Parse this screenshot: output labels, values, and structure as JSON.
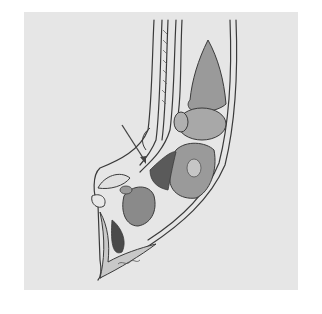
{
  "figure": {
    "style": "grayscale pen-and-ink illustration",
    "annotations": [
      {
        "type": "arrow",
        "from": [
          122,
          125
        ],
        "to": [
          146,
          163
        ]
      }
    ],
    "signature": "",
    "colors": {
      "page_background": "#ffffff",
      "panel_background": "#e6e6e6",
      "line": "#3a3a3a",
      "bone_fill": "#9a9a9a",
      "soft_tissue_fill": "#c8c8c8",
      "dark_fill": "#5a5a5a"
    }
  }
}
